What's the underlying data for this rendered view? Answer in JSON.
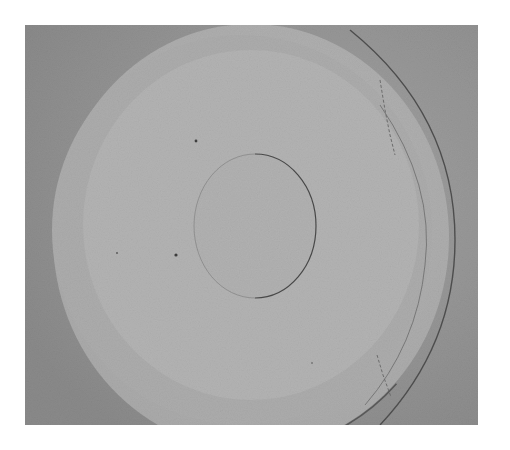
{
  "image": {
    "description": "Grayscale photograph of concentric circular discs on a gray background",
    "frame_color": "#ffffff",
    "photo_rect": {
      "x": 25,
      "y": 25,
      "width": 453,
      "height": 400
    }
  },
  "colors": {
    "background": "#9a9a9a",
    "background_dark": "#8c8c8c",
    "outer_disc": "#b1b1b1",
    "middle_ring": "#ababab",
    "inner_disc": "#b0b0b0",
    "rim_shadow": "#555555",
    "edge_line": "#6a6a6a",
    "crack": "#707070",
    "speck": "#404040"
  },
  "shapes": {
    "outer_disc": {
      "cx": 204,
      "cy": 218,
      "rx": 200,
      "ry": 212
    },
    "middle_ring": {
      "cx": 236,
      "cy": 205,
      "rx": 190,
      "ry": 192
    },
    "inner_disc": {
      "cx": 230,
      "cy": 201,
      "rx": 61,
      "ry": 72
    },
    "specks": [
      {
        "x": 171,
        "y": 116,
        "r": 1.4
      },
      {
        "x": 151,
        "y": 230,
        "r": 1.6
      },
      {
        "x": 92,
        "y": 228,
        "r": 0.9
      },
      {
        "x": 287,
        "y": 338,
        "r": 0.8
      }
    ]
  }
}
